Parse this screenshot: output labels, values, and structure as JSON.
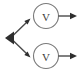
{
  "canvas": {
    "width": 81,
    "height": 75,
    "background_color": "#ffffff"
  },
  "style": {
    "stroke_color": "#4a4a4a",
    "node_stroke_color": "#7a7a7a",
    "node_fill_color": "#ffffff",
    "label_color": "#3b3b3b",
    "stroke_width": 1.4,
    "node_stroke_width": 1.1
  },
  "diagram": {
    "type": "directed-graph",
    "title": "",
    "nodes": [
      {
        "id": "branch",
        "kind": "arrowhead-marker",
        "label": "",
        "x": 10,
        "y": 38,
        "direction": "left"
      },
      {
        "id": "v-top",
        "kind": "circle",
        "label": "V",
        "x": 46,
        "y": 16,
        "radius": 12.5
      },
      {
        "id": "v-bottom",
        "kind": "circle",
        "label": "V",
        "x": 46,
        "y": 56,
        "radius": 12.5
      }
    ],
    "edges": [
      {
        "id": "edge-branch-to-top",
        "from": "branch",
        "to": "v-top",
        "label": "",
        "arrowhead": "end"
      },
      {
        "id": "edge-branch-to-bottom",
        "from": "branch",
        "to": "v-bottom",
        "label": "",
        "arrowhead": "end"
      },
      {
        "id": "edge-top-out",
        "from": "v-top",
        "to": "out-top",
        "label": "",
        "arrowhead": "end"
      },
      {
        "id": "edge-bottom-out",
        "from": "v-bottom",
        "to": "out-bottom",
        "label": "",
        "arrowhead": "end"
      }
    ]
  },
  "labels": {
    "v_top": "V",
    "v_bottom": "V"
  }
}
